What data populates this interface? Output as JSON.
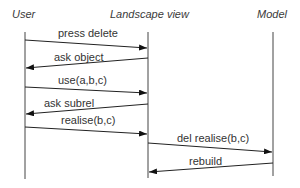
{
  "diagram": {
    "type": "sequence",
    "actors": [
      {
        "id": "user",
        "label": "User"
      },
      {
        "id": "landscape",
        "label": "Landscape view"
      },
      {
        "id": "model",
        "label": "Model"
      }
    ],
    "messages": [
      {
        "from": "user",
        "to": "landscape",
        "label": "press delete"
      },
      {
        "from": "landscape",
        "to": "user",
        "label": "ask object"
      },
      {
        "from": "user",
        "to": "landscape",
        "label": "use(a,b,c)"
      },
      {
        "from": "landscape",
        "to": "user",
        "label": "ask subrel"
      },
      {
        "from": "user",
        "to": "landscape",
        "label": "realise(b,c)"
      },
      {
        "from": "landscape",
        "to": "model",
        "label": "del realise(b,c)"
      },
      {
        "from": "model",
        "to": "landscape",
        "label": "rebuild"
      }
    ]
  }
}
